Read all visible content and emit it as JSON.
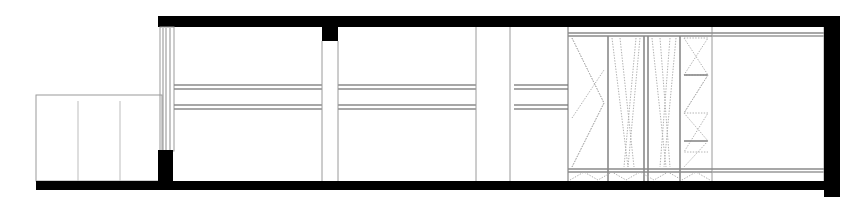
{
  "drawing": {
    "title": "Building Section",
    "type": "architectural-section",
    "canvas": {
      "width": 856,
      "height": 208,
      "background": "#ffffff"
    },
    "colors": {
      "solid_poche": "#000000",
      "thin_line": "#9a9a9a",
      "member_line": "#8a8a8a",
      "brace_line": "#b0b0b0",
      "hairline": "#bdbdbd"
    },
    "elements": {
      "roof_slab": {
        "label": "roof slab",
        "x": 158,
        "y": 16,
        "width": 682,
        "height": 11
      },
      "ground_slab": {
        "label": "ground slab",
        "x": 36,
        "y": 181,
        "width": 802,
        "height": 9
      },
      "right_end_wall": {
        "label": "right end wall",
        "x": 824,
        "y": 16,
        "width": 16,
        "height": 181
      },
      "left_wall_base": {
        "label": "left wall base poche",
        "x": 158,
        "y": 150,
        "width": 14,
        "height": 40
      },
      "roof_column_stub": {
        "label": "roof column stub",
        "x": 322,
        "y": 27,
        "width": 16,
        "height": 14
      },
      "annex": {
        "label": "left low annex",
        "x": 36,
        "y": 95,
        "width": 126,
        "height": 86,
        "dividers": [
          78,
          120
        ]
      },
      "glazing": {
        "label": "full-height glazed mullion wall",
        "x": 160,
        "y": 27,
        "width": 14,
        "height": 123,
        "mullions": [
          162,
          165,
          169,
          172
        ]
      },
      "floor_beams": [
        {
          "label": "upper floor beam",
          "y": 86,
          "x1": 174,
          "x2": 824,
          "depth": 4
        },
        {
          "label": "lower floor beam",
          "y": 106,
          "x1": 174,
          "x2": 824,
          "depth": 4
        }
      ],
      "partitions": [
        {
          "label": "partition 1",
          "x": 322,
          "y": 41,
          "height": 140
        },
        {
          "label": "partition 2",
          "x": 338,
          "y": 41,
          "height": 140
        },
        {
          "label": "partition 3",
          "x": 476,
          "y": 27,
          "height": 154
        },
        {
          "label": "partition 4",
          "x": 510,
          "y": 27,
          "height": 154
        },
        {
          "label": "partition 5",
          "x": 568,
          "y": 27,
          "height": 154
        },
        {
          "label": "partition 6",
          "x": 712,
          "y": 27,
          "height": 154
        }
      ],
      "truss_bay": {
        "label": "braced truss bay",
        "x": 568,
        "y": 32,
        "width": 144,
        "height": 148,
        "top_chord_y": 34,
        "bottom_chord_y": 170,
        "bays": [
          {
            "label": "bay A arrow brace",
            "x1": 568,
            "x2": 608
          },
          {
            "label": "bay B v brace",
            "x1": 612,
            "x2": 644
          },
          {
            "label": "bay C v brace",
            "x1": 648,
            "x2": 676
          },
          {
            "label": "bay D zigzag brace",
            "x1": 680,
            "x2": 712
          }
        ],
        "bottom_zigzag": {
          "y_top": 170,
          "y_bottom": 181,
          "teeth": 5
        }
      },
      "right_bay": {
        "label": "right open bay",
        "x": 712,
        "y": 27,
        "width": 112,
        "height": 154
      }
    }
  }
}
